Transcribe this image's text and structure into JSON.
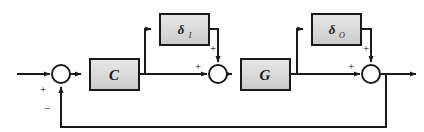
{
  "diagram": {
    "type": "block-diagram",
    "colors": {
      "line": "#1a1a1a",
      "block_fill": "#d4d4d4",
      "block_fill_light": "#e2e2e2",
      "block_stroke": "#1a1a1a",
      "junction_fill": "#ffffff",
      "background": "#ffffff"
    },
    "blocks": [
      {
        "id": "delta-i",
        "label": "δ",
        "subscript": "I",
        "x": 160,
        "y": 14,
        "width": 49,
        "height": 31
      },
      {
        "id": "delta-o",
        "label": "δ",
        "subscript": "O",
        "x": 312,
        "y": 14,
        "width": 49,
        "height": 31
      },
      {
        "id": "controller",
        "label": "C",
        "subscript": "",
        "x": 90,
        "y": 59,
        "width": 49,
        "height": 31
      },
      {
        "id": "plant",
        "label": "G",
        "subscript": "",
        "x": 241,
        "y": 59,
        "width": 49,
        "height": 31
      }
    ],
    "junctions": [
      {
        "id": "sum-error",
        "cx": 61,
        "cy": 74,
        "r": 9,
        "signs": [
          {
            "text": "+",
            "x": 43,
            "y": 93
          },
          {
            "text": "−",
            "x": 47,
            "y": 112
          }
        ]
      },
      {
        "id": "sum-input-uncertainty",
        "cx": 218,
        "cy": 74,
        "r": 9,
        "signs": [
          {
            "text": "+",
            "x": 198,
            "y": 70
          },
          {
            "text": "+",
            "x": 213,
            "y": 52
          }
        ]
      },
      {
        "id": "sum-output-uncertainty",
        "cx": 371,
        "cy": 74,
        "r": 9,
        "signs": [
          {
            "text": "+",
            "x": 351,
            "y": 70
          },
          {
            "text": "+",
            "x": 366,
            "y": 52
          }
        ]
      }
    ],
    "signals": {
      "reference_input": "reference-input-arrow",
      "output": "output-arrow",
      "feedback": "feedback-path"
    }
  }
}
